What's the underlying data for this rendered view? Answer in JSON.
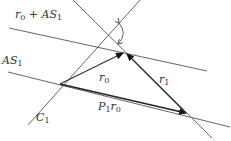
{
  "diagram": {
    "labels": {
      "shifted_space": {
        "main": "r",
        "sub": "0",
        "rest": " + AS",
        "sub2": "1"
      },
      "subspace": {
        "main": "AS",
        "sub": "1"
      },
      "constraint": {
        "main": "C",
        "sub": "1"
      },
      "r0": {
        "main": "r",
        "sub": "0"
      },
      "r1": {
        "main": "r",
        "sub": "1"
      },
      "projection": {
        "main": "P",
        "sub": "1",
        "rest": "r",
        "sub2": "0"
      }
    },
    "elements": [
      "line r0+AS1",
      "line AS1",
      "line C1",
      "line through r0 and r1 tip",
      "vector r0",
      "vector r1",
      "vector P1r0",
      "angle arc"
    ]
  }
}
